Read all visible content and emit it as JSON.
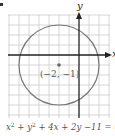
{
  "figure": {
    "bullet": "■",
    "axes": {
      "x_label": "x",
      "y_label": "y"
    },
    "center": {
      "label": "(−2, −1)",
      "x": -2,
      "y": -1
    },
    "equation": {
      "x_term": "x",
      "x_exp": "2",
      "plus1": " + ",
      "y_term": "y",
      "y_exp": "2",
      "rest": " + 4x + 2y −11 = 0"
    },
    "circle": {
      "center": [
        -2,
        -1
      ],
      "radius": 4
    },
    "grid": {
      "x_range": [
        -7,
        3
      ],
      "y_range": [
        -6,
        4
      ],
      "unit": 1
    },
    "colors": {
      "grid": "#cccccc",
      "axis": "#222222",
      "circle": "#777777",
      "center_point": "#666666",
      "text": "#555555"
    }
  }
}
